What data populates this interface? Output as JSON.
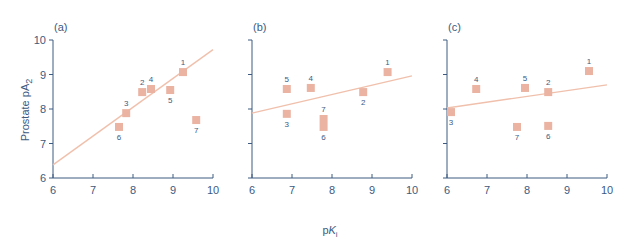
{
  "figure": {
    "ylabel_text": "Prostate pA",
    "ylabel_sub": "2",
    "xlabel_text": "pK",
    "xlabel_sub": "i"
  },
  "colors": {
    "axis": "#3d5a80",
    "marker": "#eab3a2",
    "line": "#f0c0ac"
  },
  "chart_data": [
    {
      "type": "scatter",
      "title": "(a)",
      "xlabel": "pKi",
      "ylabel": "Prostate pA2",
      "xlim": [
        6,
        10
      ],
      "ylim": [
        6,
        10
      ],
      "xticks": [
        6,
        7,
        8,
        9,
        10
      ],
      "yticks": [
        6,
        7,
        8,
        9,
        10
      ],
      "grid": false,
      "points": [
        {
          "label": "1",
          "x": 9.25,
          "y": 9.07,
          "lpos": "above"
        },
        {
          "label": "2",
          "x": 8.23,
          "y": 8.49,
          "lpos": "above"
        },
        {
          "label": "3",
          "x": 7.83,
          "y": 7.88,
          "lpos": "above"
        },
        {
          "label": "4",
          "x": 8.45,
          "y": 8.58,
          "lpos": "above"
        },
        {
          "label": "5",
          "x": 8.93,
          "y": 8.55,
          "lpos": "below"
        },
        {
          "label": "6",
          "x": 7.65,
          "y": 7.48,
          "lpos": "below"
        },
        {
          "label": "7",
          "x": 9.58,
          "y": 7.68,
          "lpos": "below"
        }
      ],
      "fit_line": {
        "x": [
          6,
          10
        ],
        "y": [
          6.38,
          9.72
        ]
      }
    },
    {
      "type": "scatter",
      "title": "(b)",
      "xlabel": "pKi",
      "ylabel": "",
      "xlim": [
        6,
        10
      ],
      "ylim": [
        6,
        10
      ],
      "xticks": [
        6,
        7,
        8,
        9,
        10
      ],
      "yticks": [
        6,
        7,
        8,
        9,
        10
      ],
      "grid": false,
      "points": [
        {
          "label": "1",
          "x": 9.39,
          "y": 9.07,
          "lpos": "above"
        },
        {
          "label": "2",
          "x": 8.78,
          "y": 8.49,
          "lpos": "below"
        },
        {
          "label": "3",
          "x": 6.87,
          "y": 7.86,
          "lpos": "below"
        },
        {
          "label": "4",
          "x": 7.47,
          "y": 8.61,
          "lpos": "above"
        },
        {
          "label": "5",
          "x": 6.87,
          "y": 8.58,
          "lpos": "above"
        },
        {
          "label": "6",
          "x": 7.79,
          "y": 7.48,
          "lpos": "below"
        },
        {
          "label": "7",
          "x": 7.79,
          "y": 7.71,
          "lpos": "above"
        }
      ],
      "fit_line": {
        "x": [
          6,
          10
        ],
        "y": [
          7.88,
          8.96
        ]
      }
    },
    {
      "type": "scatter",
      "title": "(c)",
      "xlabel": "pKi",
      "ylabel": "",
      "xlim": [
        6,
        10
      ],
      "ylim": [
        6,
        10
      ],
      "xticks": [
        6,
        7,
        8,
        9,
        10
      ],
      "yticks": [
        6,
        7,
        8,
        9,
        10
      ],
      "grid": false,
      "points": [
        {
          "label": "1",
          "x": 9.55,
          "y": 9.1,
          "lpos": "above"
        },
        {
          "label": "2",
          "x": 8.53,
          "y": 8.49,
          "lpos": "above"
        },
        {
          "label": "3",
          "x": 6.1,
          "y": 7.91,
          "lpos": "below"
        },
        {
          "label": "4",
          "x": 6.73,
          "y": 8.58,
          "lpos": "above"
        },
        {
          "label": "5",
          "x": 7.95,
          "y": 8.61,
          "lpos": "above"
        },
        {
          "label": "6",
          "x": 8.53,
          "y": 7.51,
          "lpos": "below"
        },
        {
          "label": "7",
          "x": 7.75,
          "y": 7.48,
          "lpos": "below"
        }
      ],
      "fit_line": {
        "x": [
          6,
          10
        ],
        "y": [
          8.03,
          8.7
        ]
      }
    }
  ]
}
